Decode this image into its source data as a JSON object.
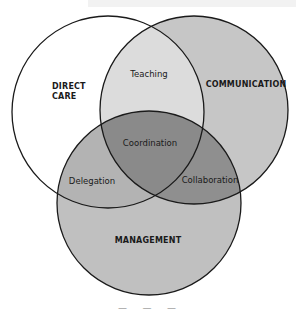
{
  "diagram": {
    "type": "venn",
    "circles": [
      {
        "id": "direct-care",
        "label": "DIRECT\nCARE",
        "fill": "#ffffff",
        "cx": 108,
        "cy": 112,
        "r": 96
      },
      {
        "id": "communication",
        "label": "COMMUNICATION",
        "fill": "#c6c6c6",
        "cx": 194,
        "cy": 110,
        "r": 94
      },
      {
        "id": "management",
        "label": "MANAGEMENT",
        "fill": "#c0c0c0",
        "cx": 149,
        "cy": 203,
        "r": 92
      }
    ],
    "intersections": {
      "teaching": {
        "label": "Teaching",
        "sets": [
          "direct-care",
          "communication"
        ],
        "fill": "#dcdcdc"
      },
      "delegation": {
        "label": "Delegation",
        "sets": [
          "direct-care",
          "management"
        ],
        "fill": "#b4b4b4"
      },
      "collaboration": {
        "label": "Collaboration",
        "sets": [
          "communication",
          "management"
        ],
        "fill": "#8e8e8e"
      },
      "coordination": {
        "label": "Coordination",
        "sets": [
          "direct-care",
          "communication",
          "management"
        ],
        "fill": "#8a8a8a"
      }
    },
    "stroke_color": "#1a1a1a",
    "caption": "—   —   —"
  }
}
